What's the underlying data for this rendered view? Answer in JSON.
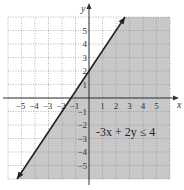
{
  "chart_data": {
    "type": "line",
    "title": "",
    "xlabel": "x",
    "ylabel": "y",
    "xlim": [
      -6,
      6
    ],
    "ylim": [
      -6,
      6
    ],
    "grid": true,
    "x_ticks": [
      "-5",
      "-4",
      "-3",
      "-2",
      "-1",
      "1",
      "2",
      "3",
      "4",
      "5"
    ],
    "y_ticks": [
      "5",
      "4",
      "3",
      "2",
      "1",
      "-1",
      "-2",
      "-3",
      "-4",
      "-5"
    ],
    "inequality": "-3x + 2y ≤ 4",
    "boundary_line": {
      "equation": "y = 1.5x + 2",
      "slope": 1.5,
      "y_intercept": 2,
      "x_intercept": -1.333,
      "style": "solid",
      "arrows": "both"
    },
    "shaded_region": "below-right of line",
    "shade_color": "#c8c8c8",
    "annotation": {
      "text": "−3x + 2y ≤ 4",
      "x": 3,
      "y": -2.5
    }
  }
}
